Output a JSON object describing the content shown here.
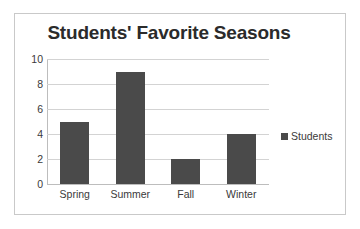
{
  "chart_data": {
    "type": "bar",
    "title": "Students' Favorite Seasons",
    "categories": [
      "Spring",
      "Summer",
      "Fall",
      "Winter"
    ],
    "values": [
      5,
      9,
      2,
      4
    ],
    "series": [
      {
        "name": "Students",
        "values": [
          5,
          9,
          2,
          4
        ]
      }
    ],
    "xlabel": "",
    "ylabel": "",
    "ylim": [
      0,
      10
    ],
    "y_ticks": [
      0,
      2,
      4,
      6,
      8,
      10
    ],
    "y_tick_labels": [
      "0",
      "2",
      "4",
      "6",
      "8",
      "10"
    ],
    "grid": true,
    "legend": {
      "position": "right",
      "entries": [
        {
          "label": "Students",
          "color": "#4a4a4a"
        }
      ]
    },
    "colors": {
      "bar": "#4a4a4a",
      "gridline": "#d3d3d3",
      "axis": "#bdbdbd",
      "title_text": "#2b2b2b",
      "tick_text": "#3a3a3a",
      "card_border": "#c9c9c9",
      "background": "#ffffff"
    }
  }
}
